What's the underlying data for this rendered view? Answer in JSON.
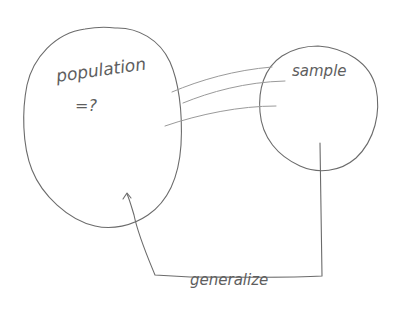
{
  "diagram": {
    "population": {
      "label": "population",
      "value": "=?"
    },
    "sample": {
      "label": "sample"
    },
    "arrow": {
      "label": "generalize",
      "from": "sample",
      "to": "population"
    },
    "colors": {
      "background": "#ffffff",
      "pencil": "#6b6b6b"
    }
  }
}
